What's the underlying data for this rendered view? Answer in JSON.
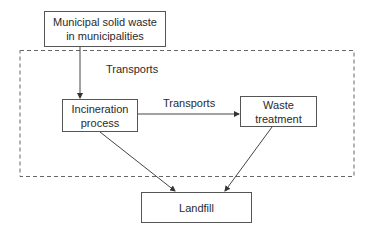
{
  "diagram": {
    "nodes": {
      "source": {
        "label_line1": "Municipal solid waste",
        "label_line2": "in municipalities"
      },
      "incineration": {
        "label_line1": "Incineration",
        "label_line2": "process"
      },
      "treatment": {
        "label_line1": "Waste",
        "label_line2": "treatment"
      },
      "landfill": {
        "label": "Landfill"
      }
    },
    "group_label": "Transports",
    "edge_label": "Transports",
    "edges": [
      {
        "from": "source",
        "to": "incineration",
        "label": ""
      },
      {
        "from": "incineration",
        "to": "treatment",
        "label": "Transports"
      },
      {
        "from": "incineration",
        "to": "landfill",
        "label": ""
      },
      {
        "from": "treatment",
        "to": "landfill",
        "label": ""
      }
    ],
    "colors": {
      "line": "#444444",
      "dashed": "#666666",
      "text": "#2a2a2a"
    }
  }
}
